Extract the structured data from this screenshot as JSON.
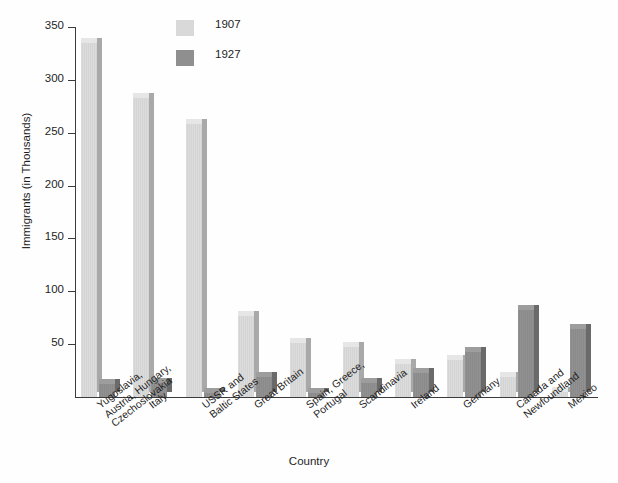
{
  "chart_data": {
    "type": "bar",
    "title": "",
    "xlabel": "Country",
    "ylabel": "Immigrants (in Thousands)",
    "ylim": [
      0,
      350
    ],
    "yticks": [
      0,
      50,
      100,
      150,
      200,
      250,
      300,
      350
    ],
    "ytick_labels": [
      "",
      "50",
      "100",
      "150",
      "200",
      "250",
      "300",
      "350"
    ],
    "grid": false,
    "legend_position": "top-left-inside",
    "categories": [
      "Yugoslavia,\nAustria, Hungary,\nCzechoslovakia",
      "Italy",
      "USSR and\nBaltic States",
      "Great Britain",
      "Spain, Greece,\nPortugal",
      "Scandinavia",
      "Ireland",
      "Germany",
      "Canada and\nNewfoundland",
      "Mexico"
    ],
    "series": [
      {
        "name": "1907",
        "color": "#d9d9d9",
        "values": [
          335,
          283,
          258,
          77,
          51,
          47,
          31,
          35,
          19,
          5
        ]
      },
      {
        "name": "1927",
        "color": "#8f8f8f",
        "values": [
          12,
          13,
          4,
          19,
          4,
          13,
          23,
          43,
          82,
          64
        ]
      }
    ]
  },
  "legend": {
    "items": [
      {
        "label": "1907",
        "swatch": "light"
      },
      {
        "label": "1927",
        "swatch": "dark"
      }
    ]
  },
  "axes": {
    "y_title": "Immigrants (in Thousands)",
    "x_title": "Country"
  }
}
